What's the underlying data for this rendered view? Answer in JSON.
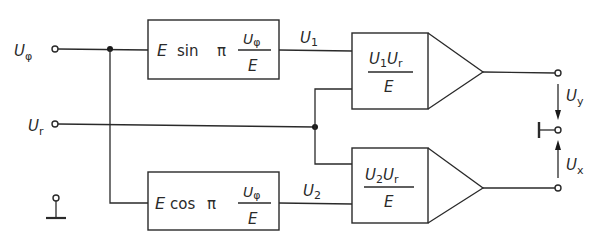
{
  "diagram": {
    "type": "block-diagram",
    "inputs": {
      "u_phi": {
        "main": "U",
        "sub": "φ"
      },
      "u_r": {
        "main": "U",
        "sub": "r"
      }
    },
    "blocks": {
      "sin_block": {
        "E": "E",
        "func": "sin",
        "pi": "π",
        "num_main": "U",
        "num_sub": "φ",
        "den": "E"
      },
      "cos_block": {
        "E": "E",
        "func": "cos",
        "pi": "π",
        "num_main": "U",
        "num_sub": "φ",
        "den": "E"
      },
      "mult1": {
        "a_main": "U",
        "a_sub": "1",
        "b_main": "U",
        "b_sub": "r",
        "den": "E"
      },
      "mult2": {
        "a_main": "U",
        "a_sub": "2",
        "b_main": "U",
        "b_sub": "r",
        "den": "E"
      }
    },
    "signals": {
      "u1": {
        "main": "U",
        "sub": "1"
      },
      "u2": {
        "main": "U",
        "sub": "2"
      }
    },
    "outputs": {
      "u_y": {
        "main": "U",
        "sub": "y"
      },
      "u_x": {
        "main": "U",
        "sub": "x"
      }
    },
    "colors": {
      "line": "#2a2a2a",
      "background": "#ffffff"
    }
  }
}
